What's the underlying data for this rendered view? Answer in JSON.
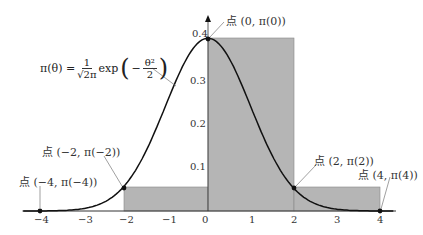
{
  "chart_data": {
    "type": "line",
    "title": "",
    "formula": {
      "lhs": "π(θ) =",
      "frac_num": "1",
      "frac_den": "√2π",
      "exp": "exp",
      "inner_sign": "−",
      "inner_num": "θ²",
      "inner_den": "2"
    },
    "curve": "standard normal density π(θ)",
    "x_ticks": [
      "−4",
      "−3",
      "−2",
      "−1",
      "0",
      "1",
      "2",
      "3",
      "4"
    ],
    "y_ticks": [
      "0.1",
      "0.2",
      "0.3",
      "0.4"
    ],
    "xlim": [
      -4.5,
      4.5
    ],
    "ylim": [
      0,
      0.42
    ],
    "rectangles": [
      {
        "x0": -2,
        "x1": 0,
        "height": 0.054
      },
      {
        "x0": 0,
        "x1": 2,
        "height": 0.399
      },
      {
        "x0": 2,
        "x1": 4,
        "height": 0.054
      }
    ],
    "points": [
      {
        "x": 0,
        "y": 0.399,
        "label": "点 (0, π(0))"
      },
      {
        "x": -2,
        "y": 0.054,
        "label": "点 (−2, π(−2))"
      },
      {
        "x": 2,
        "y": 0.054,
        "label": "点 (2, π(2))"
      },
      {
        "x": -4,
        "y": 0.0001,
        "label": "点 (−4, π(−4))"
      },
      {
        "x": 4,
        "y": 0.0001,
        "label": "点 (4, π(4))"
      }
    ],
    "fill_color": "#b5b5b5",
    "curve_color": "#111111"
  }
}
